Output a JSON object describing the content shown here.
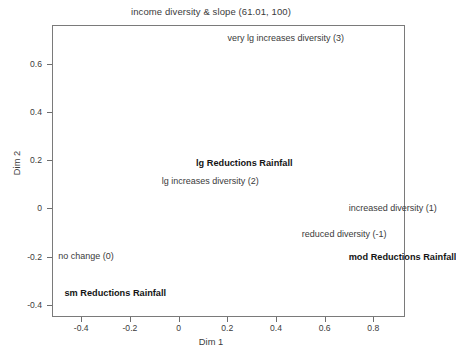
{
  "chart_data": {
    "type": "scatter",
    "title": "income diversity & slope (61.01, 100)",
    "xlabel": "Dim 1",
    "ylabel": "Dim 2",
    "xlim": [
      -0.52,
      0.93
    ],
    "ylim": [
      -0.45,
      0.76
    ],
    "grid": false,
    "legend": null,
    "xticks": [
      -0.4,
      -0.2,
      0,
      0.2,
      0.4,
      0.6,
      0.8
    ],
    "xticklabels": [
      "-0.4",
      "-0.2",
      "0",
      "0.2",
      "0.4",
      "0.6",
      "0.8"
    ],
    "yticks": [
      0.6,
      0.4,
      0.2,
      0,
      -0.2,
      -0.4
    ],
    "yticklabels": [
      "0.6",
      "0.4",
      "0.2",
      "0",
      "-0.2",
      "-0.4"
    ],
    "series": [
      {
        "name": "income diversity categories",
        "style": "regular",
        "points": [
          {
            "label": "very lg increases diversity (3)",
            "x": 0.44,
            "y": 0.705
          },
          {
            "label": "lg increases diversity (2)",
            "x": 0.13,
            "y": 0.115
          },
          {
            "label": "increased diversity (1)",
            "x": 0.88,
            "y": 0.0
          },
          {
            "label": "reduced diversity (-1)",
            "x": 0.68,
            "y": -0.105
          },
          {
            "label": "no change (0)",
            "x": -0.38,
            "y": -0.196
          }
        ]
      },
      {
        "name": "rainfall reduction categories",
        "style": "bold",
        "points": [
          {
            "label": "lg Reductions Rainfall",
            "x": 0.27,
            "y": 0.185
          },
          {
            "label": "mod Reductions Rainfall",
            "x": 0.92,
            "y": -0.205
          },
          {
            "label": "sm Reductions Rainfall",
            "x": -0.26,
            "y": -0.353
          }
        ]
      }
    ]
  },
  "labels": {
    "title": "income diversity & slope (61.01, 100)",
    "x_axis": "Dim 1",
    "y_axis": "Dim 2",
    "x_ticks": [
      "-0.4",
      "-0.2",
      "0",
      "0.2",
      "0.4",
      "0.6",
      "0.8"
    ],
    "y_ticks": [
      "0.6",
      "0.4",
      "0.2",
      "0",
      "-0.2",
      "-0.4"
    ],
    "points": [
      "very lg increases diversity (3)",
      "lg Reductions Rainfall",
      "lg increases diversity (2)",
      "increased diversity (1)",
      "reduced diversity (-1)",
      "no change (0)",
      "mod Reductions Rainfall",
      "sm Reductions Rainfall"
    ]
  },
  "colors": {
    "text": "#3b3b3b",
    "bold_text": "#151515",
    "frame": "#7a7a7a",
    "background": "#ffffff"
  }
}
